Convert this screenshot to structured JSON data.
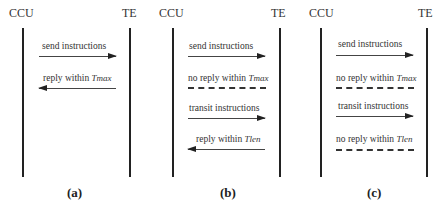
{
  "figure": {
    "actors": {
      "left": "CCU",
      "right": "TE"
    },
    "panels": [
      {
        "caption": "(a)",
        "messages": [
          {
            "text": "send instructions",
            "var": "",
            "direction": "right",
            "style": "solid"
          },
          {
            "text": "reply within ",
            "var": "Tmax",
            "direction": "left",
            "style": "solid"
          }
        ]
      },
      {
        "caption": "(b)",
        "messages": [
          {
            "text": "send instructions",
            "var": "",
            "direction": "right",
            "style": "solid"
          },
          {
            "text": "no reply within ",
            "var": "Tmax",
            "direction": "none",
            "style": "dashed"
          },
          {
            "text": "transit instructions",
            "var": "",
            "direction": "right",
            "style": "solid"
          },
          {
            "text": "reply within ",
            "var": "Tlen",
            "direction": "left",
            "style": "solid"
          }
        ]
      },
      {
        "caption": "(c)",
        "messages": [
          {
            "text": "send instructions",
            "var": "",
            "direction": "right",
            "style": "solid"
          },
          {
            "text": "no reply within ",
            "var": "Tmax",
            "direction": "none",
            "style": "dashed"
          },
          {
            "text": "transit instructions",
            "var": "",
            "direction": "right",
            "style": "solid"
          },
          {
            "text": "no reply within ",
            "var": "Tlen",
            "direction": "none",
            "style": "dashed"
          }
        ]
      }
    ]
  }
}
